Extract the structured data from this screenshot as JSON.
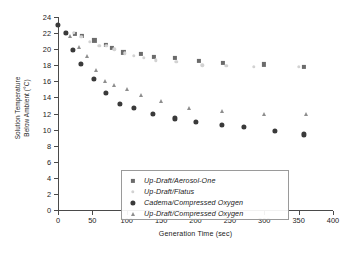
{
  "chart_data": {
    "type": "scatter",
    "title": "",
    "xlabel": "Generation Time (sec)",
    "ylabel_line1": "Solution Temperature",
    "ylabel_line2": "Below Ambient (°C)",
    "xlim": [
      0,
      400
    ],
    "ylim": [
      0,
      24
    ],
    "xticks": [
      0,
      50,
      100,
      150,
      200,
      250,
      300,
      350,
      400
    ],
    "yticks": [
      0,
      2,
      4,
      6,
      8,
      10,
      12,
      14,
      16,
      18,
      20,
      22,
      24
    ],
    "grid": false,
    "legend_position": "lower-left-inside",
    "series": [
      {
        "name": "Up-Draft/Aerosol-One",
        "marker": "square",
        "color": "#6b6b6b",
        "points": [
          [
            12,
            22.0
          ],
          [
            25,
            21.9
          ],
          [
            35,
            21.6
          ],
          [
            53,
            21.1
          ],
          [
            70,
            20.5
          ],
          [
            78,
            20.2
          ],
          [
            95,
            19.6
          ],
          [
            120,
            19.4
          ],
          [
            140,
            19.0
          ],
          [
            170,
            18.9
          ],
          [
            205,
            18.5
          ],
          [
            240,
            18.3
          ],
          [
            300,
            18.1
          ],
          [
            358,
            17.8
          ]
        ]
      },
      {
        "name": "Up-Draft/Flatus",
        "marker": "dot",
        "color": "#d2d2d2",
        "points": [
          [
            23,
            22.0
          ],
          [
            34,
            21.5
          ],
          [
            46,
            20.9
          ],
          [
            60,
            20.4
          ],
          [
            70,
            20.4
          ],
          [
            82,
            20.0
          ],
          [
            97,
            19.5
          ],
          [
            110,
            19.2
          ],
          [
            125,
            18.9
          ],
          [
            142,
            18.6
          ],
          [
            172,
            18.4
          ],
          [
            210,
            18.0
          ],
          [
            245,
            17.9
          ],
          [
            285,
            17.8
          ],
          [
            350,
            17.8
          ]
        ]
      },
      {
        "name": "Cadema/Compressed Oxygen",
        "marker": "circle",
        "color": "#3a3a3a",
        "points": [
          [
            0,
            23.0
          ],
          [
            12,
            22.0
          ],
          [
            22,
            19.9
          ],
          [
            33,
            18.2
          ],
          [
            52,
            16.3
          ],
          [
            70,
            14.6
          ],
          [
            90,
            13.2
          ],
          [
            110,
            12.7
          ],
          [
            138,
            11.9
          ],
          [
            170,
            11.4
          ],
          [
            200,
            11.0
          ],
          [
            238,
            10.6
          ],
          [
            270,
            10.3
          ],
          [
            315,
            9.85
          ],
          [
            358,
            9.4
          ]
        ]
      },
      {
        "name": "Up-Draft/Compressed Oxygen",
        "marker": "triangle",
        "color": "#8e8e8e",
        "points": [
          [
            18,
            21.6
          ],
          [
            30,
            20.3
          ],
          [
            42,
            19.1
          ],
          [
            55,
            17.4
          ],
          [
            68,
            16.0
          ],
          [
            82,
            15.5
          ],
          [
            100,
            15.0
          ],
          [
            120,
            14.3
          ],
          [
            150,
            13.5
          ],
          [
            190,
            12.7
          ],
          [
            238,
            12.3
          ],
          [
            300,
            11.9
          ],
          [
            360,
            11.9
          ]
        ]
      }
    ]
  }
}
